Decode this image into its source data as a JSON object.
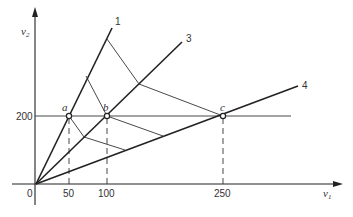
{
  "diagram": {
    "axes": {
      "x_label": "v",
      "x_sub": "1",
      "y_label": "v",
      "y_sub": "2",
      "origin_label": "0",
      "x_ticks": [
        "50",
        "100",
        "250"
      ],
      "y_ticks": [
        "200"
      ]
    },
    "rays": [
      {
        "label": "1"
      },
      {
        "label": "3"
      },
      {
        "label": "4"
      }
    ],
    "points": [
      {
        "label": "a",
        "x": 50,
        "y": 200
      },
      {
        "label": "b",
        "x": 100,
        "y": 200
      },
      {
        "label": "c",
        "x": 250,
        "y": 200
      }
    ]
  }
}
